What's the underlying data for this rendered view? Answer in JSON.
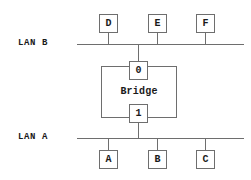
{
  "diagram": {
    "line_color": "#6e6e6e",
    "text_color": "#1a1a1a",
    "background": "#ffffff",
    "buses": [
      {
        "id": "lan-b",
        "label": "LAN B",
        "label_x": 18,
        "label_y": 38,
        "line_x": 77,
        "line_y": 44,
        "line_width": 167
      },
      {
        "id": "lan-a",
        "label": "LAN A",
        "label_x": 18,
        "label_y": 132,
        "line_x": 77,
        "line_y": 138,
        "line_width": 167
      }
    ],
    "nodes": [
      {
        "id": "node-d",
        "label": "D",
        "bus": "lan-b",
        "x": 99,
        "y": 14,
        "stub_x": 108,
        "stub_y": 33,
        "stub_height": 11
      },
      {
        "id": "node-e",
        "label": "E",
        "bus": "lan-b",
        "x": 148,
        "y": 14,
        "stub_x": 157,
        "stub_y": 33,
        "stub_height": 11
      },
      {
        "id": "node-f",
        "label": "F",
        "bus": "lan-b",
        "x": 196,
        "y": 14,
        "stub_x": 205,
        "stub_y": 33,
        "stub_height": 11
      },
      {
        "id": "node-a",
        "label": "A",
        "bus": "lan-a",
        "x": 99,
        "y": 150,
        "stub_x": 108,
        "stub_y": 138,
        "stub_height": 12
      },
      {
        "id": "node-b",
        "label": "B",
        "bus": "lan-a",
        "x": 148,
        "y": 150,
        "stub_x": 157,
        "stub_y": 138,
        "stub_height": 12
      },
      {
        "id": "node-c",
        "label": "C",
        "bus": "lan-a",
        "x": 196,
        "y": 150,
        "stub_x": 205,
        "stub_y": 138,
        "stub_height": 12
      }
    ],
    "bridge": {
      "label": "Bridge",
      "x": 101,
      "y": 66,
      "width": 76,
      "height": 52,
      "label_y": 85,
      "ports": [
        {
          "id": "port-0",
          "label": "0",
          "x": 129,
          "y": 61,
          "connects": "lan-b",
          "stub_x": 138,
          "stub_y": 44,
          "stub_height": 17
        },
        {
          "id": "port-1",
          "label": "1",
          "x": 129,
          "y": 104,
          "connects": "lan-a",
          "stub_x": 138,
          "stub_y": 123,
          "stub_height": 15
        }
      ]
    }
  }
}
